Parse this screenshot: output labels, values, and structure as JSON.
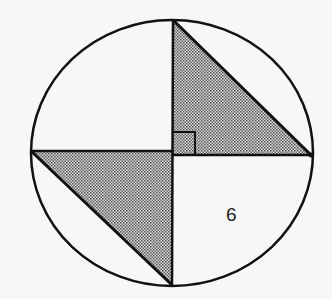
{
  "diagram": {
    "type": "geometry",
    "labels": {
      "region_label": "6"
    },
    "colors": {
      "stroke": "#111111",
      "shade": "#8a8a8a",
      "background": "#f7f7f7"
    },
    "right_angle_marker": true
  }
}
